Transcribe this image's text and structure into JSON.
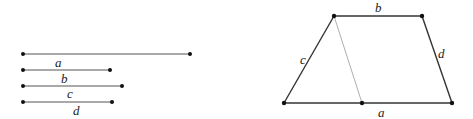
{
  "segments": {
    "a": {
      "label": "a",
      "x1": 23,
      "x2": 190,
      "y": 54,
      "label_x": 55,
      "label_y": 66
    },
    "b": {
      "label": "b",
      "x1": 23,
      "x2": 110,
      "y": 70,
      "label_x": 62,
      "label_y": 82
    },
    "c": {
      "label": "c",
      "x1": 23,
      "x2": 122,
      "y": 86,
      "label_x": 68,
      "label_y": 98
    },
    "d": {
      "label": "d",
      "x1": 23,
      "x2": 112,
      "y": 102,
      "label_x": 74,
      "label_y": 114
    }
  },
  "trapezoid": {
    "top_left": [
      334,
      16
    ],
    "top_right": [
      422,
      16
    ],
    "bottom_right": [
      452,
      103
    ],
    "bottom_left": [
      284,
      103
    ],
    "split_point": [
      362,
      103
    ],
    "labels": {
      "a": "a",
      "b": "b",
      "c": "c",
      "d": "d"
    }
  },
  "colors": {
    "line": "#333333",
    "thin_line": "#999999",
    "point": "#111111"
  }
}
